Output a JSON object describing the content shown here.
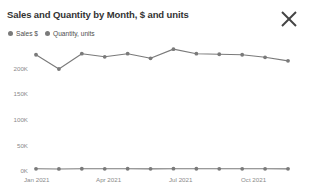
{
  "header": {
    "title": "Sales and Quantity by Month, $ and units",
    "close_label": "✕"
  },
  "legend": {
    "position": "top-left",
    "items": [
      {
        "label": "Sales $",
        "color": "#7a7a7a"
      },
      {
        "label": "Quantity, units",
        "color": "#7a7a7a"
      }
    ]
  },
  "axes": {
    "y_ticks": [
      "200K",
      "150K",
      "100K",
      "50K",
      "0K"
    ],
    "x_ticks": [
      "Jan 2021",
      "Apr 2021",
      "Jul 2021",
      "Oct 2021"
    ]
  },
  "chart_data": {
    "type": "line",
    "title": "Sales and Quantity by Month, $ and units",
    "xlabel": "",
    "ylabel": "",
    "grid": false,
    "legend_position": "top-left",
    "ylim": [
      0,
      250000
    ],
    "ytick_values": [
      0,
      50000,
      100000,
      150000,
      200000
    ],
    "ytick_labels": [
      "0K",
      "50K",
      "100K",
      "150K",
      "200K"
    ],
    "categories": [
      "Jan 2021",
      "Feb 2021",
      "Mar 2021",
      "Apr 2021",
      "May 2021",
      "Jun 2021",
      "Jul 2021",
      "Aug 2021",
      "Sep 2021",
      "Oct 2021",
      "Nov 2021",
      "Dec 2021"
    ],
    "xtick_labels": [
      "Jan 2021",
      "Apr 2021",
      "Jul 2021",
      "Oct 2021"
    ],
    "series": [
      {
        "name": "Sales $",
        "color": "#7a7a7a",
        "marker": "circle",
        "values": [
          226000,
          198000,
          228000,
          222000,
          228000,
          219000,
          237000,
          228000,
          227000,
          226000,
          221000,
          214000
        ]
      },
      {
        "name": "Quantity, units",
        "color": "#7a7a7a",
        "marker": "circle",
        "values": [
          2400,
          2100,
          2450,
          2350,
          2420,
          2300,
          2500,
          2420,
          2400,
          2390,
          2340,
          2260
        ]
      }
    ]
  }
}
